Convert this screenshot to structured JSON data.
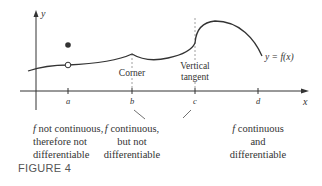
{
  "figure": {
    "label": "FIGURE 4",
    "axes": {
      "x_label": "x",
      "y_label": "y",
      "ticks": [
        {
          "name": "a",
          "x": 68
        },
        {
          "name": "b",
          "x": 132
        },
        {
          "name": "c",
          "x": 195
        },
        {
          "name": "d",
          "x": 258
        }
      ]
    },
    "curve_label": "y = f(x)",
    "annotations": {
      "corner": "Corner",
      "vertical_tangent_line1": "Vertical",
      "vertical_tangent_line2": "tangent"
    },
    "captions": {
      "a": {
        "f": "f",
        "text": " not continuous,\ntherefore not\ndifferentiable"
      },
      "b": {
        "f": "f",
        "text": " continuous,\nbut not\ndifferentiable"
      },
      "d": {
        "f": "f",
        "text": " continuous\nand\ndifferentiable"
      }
    },
    "colors": {
      "ink": "#333333",
      "dashed": "#888888"
    }
  }
}
